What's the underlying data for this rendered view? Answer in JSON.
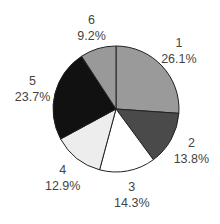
{
  "chart_data": {
    "type": "pie",
    "title": "",
    "start": "top",
    "direction": "clockwise",
    "categories": [
      "1",
      "2",
      "3",
      "4",
      "5",
      "6"
    ],
    "values": [
      26.1,
      13.8,
      14.3,
      12.9,
      23.7,
      9.2
    ],
    "value_labels": [
      "26.1%",
      "13.8%",
      "14.3%",
      "12.9%",
      "23.7%",
      "9.2%"
    ],
    "colors": [
      "#9a9a9a",
      "#4a4a4a",
      "#ffffff",
      "#ededed",
      "#111111",
      "#999999"
    ],
    "legend": "none"
  }
}
